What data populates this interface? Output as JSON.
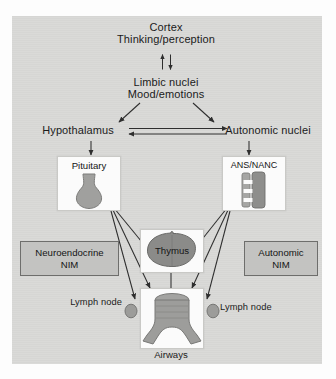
{
  "figure": {
    "background_color": "#d9d9d7",
    "panel_color": "#fbfbfb",
    "nim_box_color": "#c3c3c1",
    "organ_color": "#9a9a98",
    "arrow_color": "#2e2e2e"
  },
  "nodes": {
    "cortex": {
      "line1": "Cortex",
      "line2": "Thinking/perception"
    },
    "limbic": {
      "line1": "Limbic nuclei",
      "line2": "Mood/emotions"
    },
    "hypothalamus": {
      "label": "Hypothalamus"
    },
    "autonomic_nuclei": {
      "label": "Autonomic nuclei"
    },
    "pituitary": {
      "label": "Pituitary",
      "icon": "pituitary-gland-icon"
    },
    "ans_nanc": {
      "label": "ANS/NANC",
      "icon": "nerve-trunk-icon"
    },
    "thymus": {
      "label": "Thymus",
      "icon": "thymus-gland-icon"
    },
    "airways": {
      "label": "Airways",
      "icon": "trachea-bronchi-icon"
    },
    "lymph_node_left": {
      "label": "Lymph node",
      "icon": "lymph-node-icon"
    },
    "lymph_node_right": {
      "label": "Lymph node",
      "icon": "lymph-node-icon"
    },
    "neuroendocrine_nim": {
      "line1": "Neuroendocrine",
      "line2": "NIM"
    },
    "autonomic_nim": {
      "line1": "Autonomic",
      "line2": "NIM"
    }
  },
  "edges": [
    {
      "from": "cortex",
      "to": "limbic",
      "type": "bidirectional-vertical"
    },
    {
      "from": "limbic",
      "to": "hypothalamus",
      "type": "arrow"
    },
    {
      "from": "limbic",
      "to": "autonomic_nuclei",
      "type": "arrow"
    },
    {
      "from": "hypothalamus",
      "to": "autonomic_nuclei",
      "type": "arrow"
    },
    {
      "from": "autonomic_nuclei",
      "to": "hypothalamus",
      "type": "arrow"
    },
    {
      "from": "hypothalamus",
      "to": "pituitary",
      "type": "arrow"
    },
    {
      "from": "autonomic_nuclei",
      "to": "ans_nanc",
      "type": "arrow"
    },
    {
      "from": "pituitary",
      "to": "thymus",
      "type": "arrow"
    },
    {
      "from": "pituitary",
      "to": "airways",
      "type": "arrow"
    },
    {
      "from": "pituitary",
      "to": "lymph_node_left",
      "type": "arrow"
    },
    {
      "from": "ans_nanc",
      "to": "thymus",
      "type": "arrow"
    },
    {
      "from": "ans_nanc",
      "to": "airways",
      "type": "arrow"
    },
    {
      "from": "ans_nanc",
      "to": "lymph_node_right",
      "type": "arrow"
    },
    {
      "from": "thymus",
      "to": "airways",
      "type": "line"
    }
  ]
}
